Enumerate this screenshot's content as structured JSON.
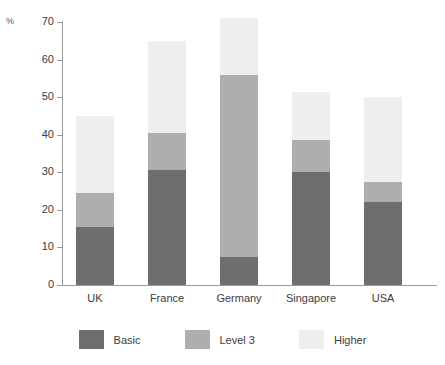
{
  "chart_data": {
    "type": "bar",
    "subtype": "stacked-bar",
    "title": "",
    "xlabel": "",
    "ylabel": "%",
    "ylim": [
      0,
      70
    ],
    "yticks": [
      0,
      10,
      20,
      30,
      40,
      50,
      60,
      70
    ],
    "ytick_labels": [
      "0",
      "10",
      "20",
      "30",
      "40",
      "50",
      "60",
      "70"
    ],
    "grid": false,
    "legend_position": "bottom",
    "categories": [
      "UK",
      "France",
      "Germany",
      "Singapore",
      "USA"
    ],
    "series": [
      {
        "name": "Basic",
        "color": "#6e6e6e",
        "values": [
          15.5,
          30.5,
          7.5,
          30.0,
          22.0
        ]
      },
      {
        "name": "Level 3",
        "color": "#aeaeae",
        "values": [
          9.0,
          10.0,
          48.5,
          8.5,
          5.5
        ]
      },
      {
        "name": "Higher",
        "color": "#eeeeee",
        "values": [
          20.5,
          24.5,
          15.0,
          13.0,
          22.5
        ]
      }
    ],
    "cumulative_tops": {
      "Basic": [
        15.5,
        30.5,
        7.5,
        30.0,
        22.0
      ],
      "Level 3": [
        24.5,
        40.5,
        56.0,
        38.5,
        27.5
      ],
      "Higher": [
        45.0,
        65.0,
        71.0,
        51.5,
        50.0
      ]
    },
    "totals": [
      45.0,
      65.0,
      71.0,
      51.5,
      50.0
    ]
  },
  "axis": {
    "unit_label": "%"
  },
  "legend": {
    "items": [
      {
        "label": "Basic",
        "color": "#6e6e6e"
      },
      {
        "label": "Level 3",
        "color": "#aeaeae"
      },
      {
        "label": "Higher",
        "color": "#eeeeee"
      }
    ]
  },
  "colors": {
    "basic": "#6e6e6e",
    "level3": "#aeaeae",
    "higher": "#eeeeee",
    "axis": "#9a9a9a",
    "text": "#3c3c40",
    "background": "#ffffff"
  }
}
